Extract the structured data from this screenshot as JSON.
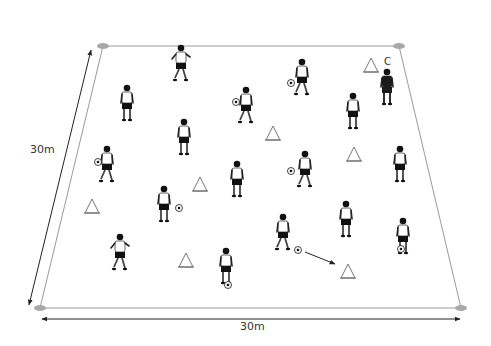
{
  "diagram": {
    "type": "soccer-drill-field",
    "colors": {
      "field_line": "#9a9a9a",
      "corner_marker": "#a8a8a8",
      "dimension_arrow": "#222222",
      "shirt": "#ffffff",
      "shorts": "#111111",
      "coach": "#1a1a1a",
      "cone_stroke": "#777777"
    },
    "field": {
      "corners": [
        [
          103,
          46
        ],
        [
          399,
          46
        ],
        [
          461,
          308
        ],
        [
          40,
          308
        ]
      ]
    },
    "dimensions": {
      "left_label": "30m",
      "bottom_label": "30m"
    },
    "coach": {
      "label": "C",
      "x": 387,
      "y": 92
    },
    "cones": [
      [
        371,
        58
      ],
      [
        273,
        126
      ],
      [
        354,
        147
      ],
      [
        200,
        177
      ],
      [
        92,
        199
      ],
      [
        186,
        253
      ],
      [
        348,
        264
      ]
    ],
    "players": [
      {
        "x": 181,
        "y": 44,
        "pose": "running"
      },
      {
        "x": 302,
        "y": 58,
        "pose": "dribbling",
        "ball": [
          291,
          83
        ]
      },
      {
        "x": 127,
        "y": 84,
        "pose": "standing"
      },
      {
        "x": 246,
        "y": 86,
        "pose": "dribbling",
        "ball": [
          236,
          102
        ]
      },
      {
        "x": 353,
        "y": 92,
        "pose": "standing"
      },
      {
        "x": 184,
        "y": 118,
        "pose": "standing"
      },
      {
        "x": 107,
        "y": 145,
        "pose": "dribbling",
        "ball": [
          98,
          162
        ]
      },
      {
        "x": 237,
        "y": 160,
        "pose": "standing"
      },
      {
        "x": 305,
        "y": 150,
        "pose": "dribbling",
        "ball": [
          291,
          171
        ]
      },
      {
        "x": 400,
        "y": 145,
        "pose": "standing"
      },
      {
        "x": 164,
        "y": 185,
        "pose": "standing",
        "ball": [
          179,
          208
        ]
      },
      {
        "x": 346,
        "y": 200,
        "pose": "standing"
      },
      {
        "x": 283,
        "y": 213,
        "pose": "passing",
        "ball": [
          298,
          250
        ]
      },
      {
        "x": 403,
        "y": 217,
        "pose": "standing",
        "ball": [
          401,
          249
        ]
      },
      {
        "x": 120,
        "y": 233,
        "pose": "running"
      },
      {
        "x": 226,
        "y": 247,
        "pose": "standing",
        "ball": [
          228,
          285
        ]
      }
    ],
    "pass_arrow": {
      "from": [
        305,
        252
      ],
      "to": [
        335,
        264
      ]
    }
  }
}
